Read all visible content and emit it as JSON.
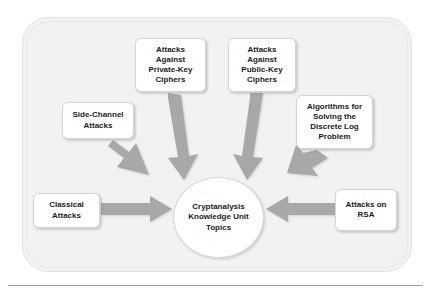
{
  "diagram": {
    "type": "hub-and-spoke",
    "title_hub": "Cryptanalysis\nKnowledge Unit\nTopics",
    "hub_label": "Cryptanalysis Knowledge Unit Topics",
    "arrow_color": "#a6a6a6",
    "node_fill": "#ffffff",
    "panel_fill": "#f2f2f2",
    "text_color": "#1a1a1a",
    "nodes": [
      {
        "id": "attacks-private-key",
        "label": "Attacks\nAgainst\nPrivate-Key\nCiphers",
        "x": 135,
        "y": 38,
        "w": 71,
        "h": 54
      },
      {
        "id": "attacks-public-key",
        "label": "Attacks\nAgainst\nPublic-Key\nCiphers",
        "x": 228,
        "y": 38,
        "w": 68,
        "h": 54
      },
      {
        "id": "side-channel-attacks",
        "label": "Side-Channel\nAttacks",
        "x": 62,
        "y": 102,
        "w": 72,
        "h": 37
      },
      {
        "id": "algorithms-dlp",
        "label": "Algorithms for\nSolving the\nDiscrete Log\nProblem",
        "x": 296,
        "y": 95,
        "w": 77,
        "h": 54
      },
      {
        "id": "classical-attacks",
        "label": "Classical\nAttacks",
        "x": 33,
        "y": 193,
        "w": 67,
        "h": 35
      },
      {
        "id": "attacks-on-rsa",
        "label": "Attacks on\nRSA",
        "x": 335,
        "y": 189,
        "w": 62,
        "h": 42
      }
    ],
    "edges": [
      {
        "from": "attacks-private-key",
        "to": "hub",
        "direction": "down-right"
      },
      {
        "from": "attacks-public-key",
        "to": "hub",
        "direction": "down-left"
      },
      {
        "from": "side-channel-attacks",
        "to": "hub",
        "direction": "down-right"
      },
      {
        "from": "algorithms-dlp",
        "to": "hub",
        "direction": "down-left"
      },
      {
        "from": "classical-attacks",
        "to": "hub",
        "direction": "right"
      },
      {
        "from": "attacks-on-rsa",
        "to": "hub",
        "direction": "left"
      }
    ]
  }
}
